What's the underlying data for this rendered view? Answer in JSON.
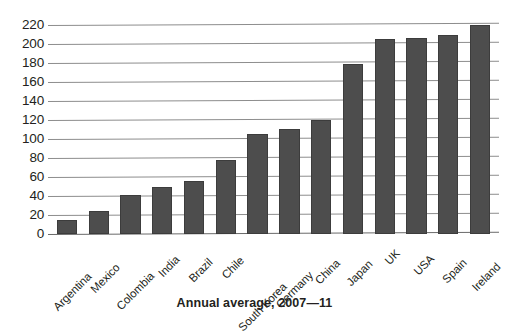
{
  "chart_data": {
    "type": "bar",
    "title": "",
    "caption": "Annual average, 2007—11",
    "xlabel": "",
    "ylabel": "",
    "ylim": [
      0,
      220
    ],
    "ytick_step": 20,
    "yticks": [
      220,
      200,
      180,
      160,
      140,
      120,
      100,
      80,
      60,
      40,
      20,
      0
    ],
    "grid": true,
    "legend": "none",
    "bar_color": "#4d4d4d",
    "gridline_color": "#8d8d8d",
    "categories": [
      "Argentina",
      "Mexico",
      "Colombia",
      "India",
      "Brazil",
      "Chile",
      "South Korea",
      "Germany",
      "China",
      "Japan",
      "UK",
      "USA",
      "Spain",
      "Ireland"
    ],
    "values": [
      15,
      24,
      41,
      50,
      56,
      78,
      105,
      111,
      120,
      179,
      205,
      206,
      210,
      220
    ]
  }
}
